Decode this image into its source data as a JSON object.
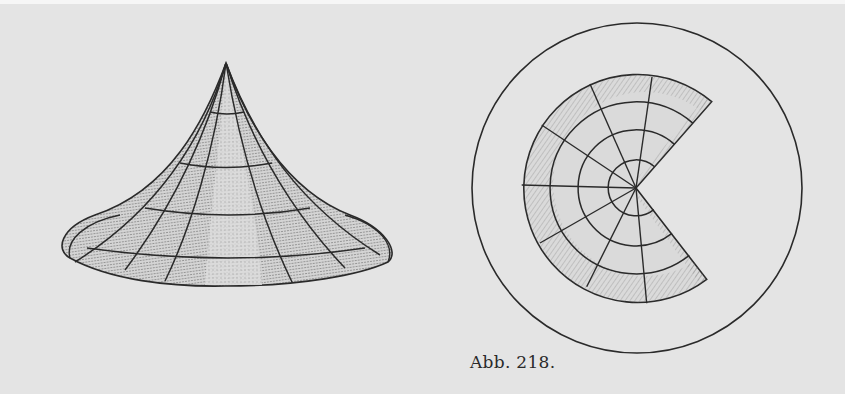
{
  "figure": {
    "caption": "Abb. 218.",
    "colors": {
      "background": "#e4e4e4",
      "ink": "#2a2a2a",
      "shade": "#8a8a8a"
    },
    "cone": {
      "description": "Concave cone surface with grid of meridians and parallels",
      "apex": [
        226,
        63
      ],
      "base_center": [
        225,
        250
      ],
      "base_rx": 165,
      "base_ry": 36,
      "parallels": 4,
      "meridians": 7
    },
    "development": {
      "description": "Flat development of the cone as a circular sector inside a circle",
      "outer_circle": {
        "cx": 637,
        "cy": 188,
        "r": 165
      },
      "sector_center": [
        636,
        188
      ],
      "ring_radii": [
        28,
        58,
        86,
        114
      ],
      "spokes": 8
    }
  }
}
